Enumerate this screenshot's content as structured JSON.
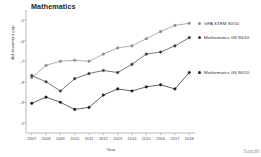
{
  "chart_data": {
    "type": "line",
    "title": "Mathematics",
    "xlabel": "Year",
    "ylabel": "Achievement gap",
    "x": [
      2007,
      2008,
      2009,
      2010,
      2011,
      2012,
      2013,
      2014,
      2015,
      2016,
      2017,
      2018
    ],
    "xtick_labels": [
      "2007",
      "2008",
      "2009",
      "2010",
      "2011",
      "2012",
      "2013",
      "2014",
      "2015",
      "2016",
      "2017",
      "2018"
    ],
    "ytick_labels": [
      "-.5",
      "-.6",
      "-.7",
      "-.8",
      "-.9",
      "-1"
    ],
    "ytick_values": [
      -0.5,
      -0.6,
      -0.7,
      -0.8,
      -0.9,
      -1.0
    ],
    "ylim": [
      -1.05,
      -0.45
    ],
    "xlim": [
      2006.6,
      2018.4
    ],
    "grid": false,
    "legend_position": "right",
    "series": [
      {
        "name": "GPA STEM 90/10",
        "color": "#8c8c8c",
        "values": [
          -0.78,
          -0.72,
          -0.7,
          -0.695,
          -0.7,
          -0.665,
          -0.635,
          -0.625,
          -0.59,
          -0.555,
          -0.525,
          -0.515
        ]
      },
      {
        "name": "Mathematics G8 90/10",
        "color": "#3d3d3d",
        "values": [
          -0.77,
          -0.8,
          -0.845,
          -0.785,
          -0.76,
          -0.745,
          -0.755,
          -0.715,
          -0.665,
          -0.655,
          -0.625,
          -0.585
        ]
      },
      {
        "name": "Mathematics G5 90/10",
        "color": "#1f1f1f",
        "values": [
          -0.905,
          -0.875,
          -0.9,
          -0.935,
          -0.925,
          -0.865,
          -0.835,
          -0.845,
          -0.825,
          -0.815,
          -0.835,
          -0.755
        ]
      }
    ],
    "legend": [
      {
        "label": "GPA STEM 90/10",
        "color": "#8c8c8c"
      },
      {
        "label": "Mathematics G8 90/10",
        "color": "#3d3d3d"
      },
      {
        "label": "Mathematics G5 90/10",
        "color": "#1f1f1f"
      }
    ],
    "axis_color": "#9b9b9b"
  },
  "watermark": "Sandb"
}
